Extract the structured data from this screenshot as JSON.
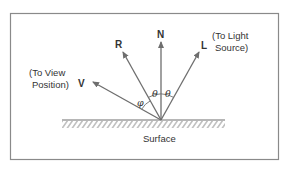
{
  "diagram": {
    "colors": {
      "line": "#6e6e6e",
      "frame": "#8a8a8a",
      "text": "#333333",
      "background": "#ffffff"
    },
    "vectors": {
      "N": {
        "label": "N"
      },
      "R": {
        "label": "R"
      },
      "L": {
        "label": "L",
        "note_line1": "(To Light",
        "note_line2": "Source)"
      },
      "V": {
        "label": "V",
        "note_line1": "(To View",
        "note_line2": "Position)"
      }
    },
    "angles": {
      "phi": "φ",
      "theta_left": "θ",
      "theta_right": "θ"
    },
    "surface": {
      "label": "Surface"
    }
  }
}
